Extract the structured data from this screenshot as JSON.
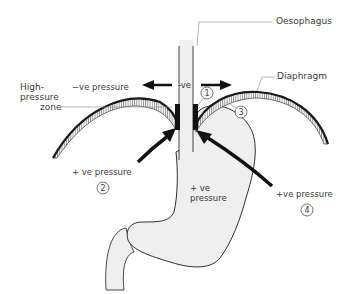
{
  "diagram": {
    "type": "anatomical schematic",
    "colors": {
      "outline": "#1a1a1a",
      "organ_fill": "#efefef",
      "leader_line": "#9a9a9a",
      "text": "#3a3a3a"
    }
  },
  "labels": {
    "oesophagus": "Oesophagus",
    "diaphragm": "Diaphragm",
    "high_pressure_zone": [
      "High-",
      "pressure",
      "zone"
    ],
    "neg_pressure_left": "−ve  pressure",
    "neg_pressure_center": "-ve",
    "pos_pressure_left": "+ ve  pressure",
    "pos_pressure_stomach": [
      "+ ve",
      "pressure"
    ],
    "pos_pressure_right": "+ve  pressure"
  },
  "markers": [
    {
      "id": "1",
      "label": "1"
    },
    {
      "id": "2",
      "label": "2"
    },
    {
      "id": "3",
      "label": "3"
    },
    {
      "id": "4",
      "label": "4"
    }
  ],
  "arrows": [
    {
      "name": "neg-pressure-left-arrow",
      "direction": "left"
    },
    {
      "name": "neg-pressure-right-arrow",
      "direction": "right"
    },
    {
      "name": "pos-pressure-left-arrow",
      "direction": "up-right"
    },
    {
      "name": "pos-pressure-right-arrow",
      "direction": "up-left"
    }
  ]
}
